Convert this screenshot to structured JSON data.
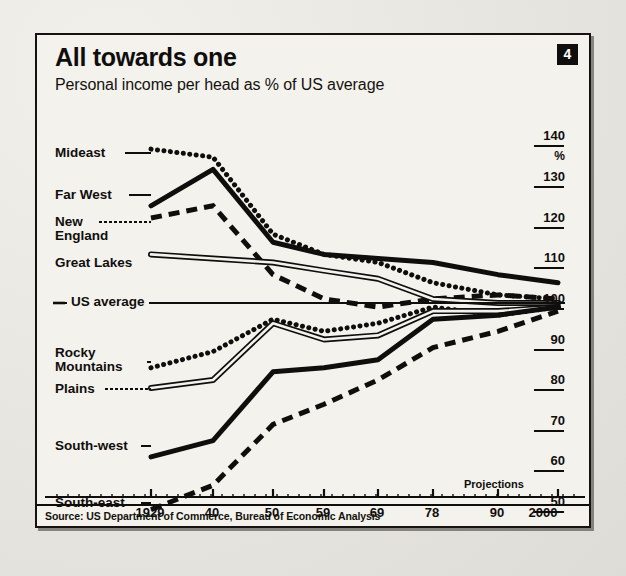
{
  "figure": {
    "title": "All towards one",
    "subtitle": "Personal income per head as % of US average",
    "badge": "4",
    "projections_note": "Projections",
    "source": "Source: US Department of Commerce, Bureau of Economic Analysis",
    "us_average_label": "US average",
    "percent_symbol": "%"
  },
  "colors": {
    "ink": "#100e0c",
    "paper": "#f4f2ed",
    "background": "#e9e7e2"
  },
  "chart_data": {
    "type": "line",
    "title": "All towards one",
    "subtitle": "Personal income per head as % of US average",
    "xlabel": "",
    "ylabel": "%",
    "ylim": [
      45,
      142
    ],
    "yticks": [
      50,
      60,
      70,
      80,
      90,
      100,
      110,
      120,
      130,
      140
    ],
    "grid": false,
    "legend": "inline-left",
    "reference_line": {
      "value": 100,
      "label": "US average"
    },
    "x": [
      "1929",
      "40",
      "50",
      "59",
      "69",
      "78",
      "90",
      "2000"
    ],
    "projection_from": "90",
    "series": [
      {
        "name": "Mideast",
        "style": "dotted",
        "values": [
          138,
          136,
          117,
          112,
          110,
          105,
          102,
          101
        ]
      },
      {
        "name": "Far West",
        "style": "solid-thick",
        "values": [
          124,
          133,
          115,
          112,
          111,
          110,
          107,
          105
        ]
      },
      {
        "name": "New England",
        "style": "dashed",
        "values": [
          121,
          124,
          107,
          101,
          99,
          101,
          102,
          101
        ]
      },
      {
        "name": "Great Lakes",
        "style": "double-line",
        "values": [
          112,
          111,
          110,
          108,
          106,
          101,
          100,
          100
        ]
      },
      {
        "name": "Rocky Mountains",
        "style": "dotted",
        "values": [
          84,
          88,
          96,
          93,
          95,
          99,
          97,
          99
        ]
      },
      {
        "name": "Plains",
        "style": "double-line",
        "values": [
          79,
          81,
          95,
          91,
          92,
          98,
          98,
          99
        ]
      },
      {
        "name": "South-west",
        "style": "solid-thick",
        "values": [
          62,
          66,
          83,
          84,
          86,
          96,
          97,
          99
        ]
      },
      {
        "name": "South-east",
        "style": "dashed",
        "values": [
          49,
          55,
          70,
          75,
          81,
          89,
          93,
          98
        ]
      }
    ]
  },
  "y_axis": {
    "ticks": [
      {
        "label": "140",
        "top": 93,
        "line": true
      },
      {
        "label": "%",
        "top": 114,
        "line": false
      },
      {
        "label": "130",
        "top": 134,
        "line": true
      },
      {
        "label": "120",
        "top": 175,
        "line": true
      },
      {
        "label": "110",
        "top": 215,
        "line": true
      },
      {
        "label": "100",
        "top": 256,
        "line": true
      },
      {
        "label": "90",
        "top": 297,
        "line": true
      },
      {
        "label": "80",
        "top": 337,
        "line": true
      },
      {
        "label": "70",
        "top": 378,
        "line": true
      },
      {
        "label": "60",
        "top": 418,
        "line": true
      },
      {
        "label": "50",
        "top": 459,
        "line": true
      }
    ]
  },
  "x_axis": {
    "ticks": [
      {
        "label": "1929",
        "left": 113
      },
      {
        "label": "40",
        "left": 175
      },
      {
        "label": "50",
        "left": 235
      },
      {
        "label": "59",
        "left": 286
      },
      {
        "label": "69",
        "left": 340
      },
      {
        "label": "78",
        "left": 395
      },
      {
        "label": "90",
        "left": 460
      },
      {
        "label": "2000",
        "left": 506
      }
    ]
  },
  "series_labels": [
    {
      "name": "Mideast",
      "text": "Mideast",
      "left": 18,
      "top": 111,
      "lead_x1": 88,
      "lead_x2": 114,
      "lead_y": 118
    },
    {
      "name": "Far West",
      "text": "Far West",
      "left": 18,
      "top": 153,
      "lead_x1": 92,
      "lead_x2": 114,
      "lead_y": 160
    },
    {
      "name": "New England",
      "text": "New\nEngland",
      "left": 18,
      "top": 180,
      "lead_x1": 62,
      "lead_x2": 114,
      "lead_y": 187
    },
    {
      "name": "Great Lakes",
      "text": "Great Lakes",
      "left": 18,
      "top": 221,
      "lead_x1": 112,
      "lead_x2": 114,
      "lead_y": 228
    },
    {
      "name": "Rocky Mountains",
      "text": "Rocky\nMountains",
      "left": 18,
      "top": 311,
      "lead_x1": 110,
      "lead_x2": 114,
      "lead_y": 327
    },
    {
      "name": "Plains",
      "text": "Plains",
      "left": 18,
      "top": 347,
      "lead_x1": 68,
      "lead_x2": 114,
      "lead_y": 354
    },
    {
      "name": "South-west",
      "text": "South-west",
      "left": 18,
      "top": 404,
      "lead_x1": 104,
      "lead_x2": 114,
      "lead_y": 411
    },
    {
      "name": "South-east",
      "text": "South-east",
      "left": 18,
      "top": 461,
      "lead_x1": 104,
      "lead_x2": 114,
      "lead_y": 468
    }
  ]
}
